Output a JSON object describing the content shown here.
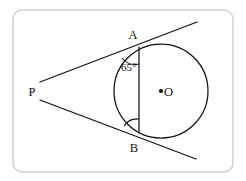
{
  "figure": {
    "kind": "geometry-diagram",
    "canvas": {
      "width": 246,
      "height": 181,
      "background": "#ffffff"
    },
    "frame": {
      "name": "rounded-border",
      "x": 13,
      "y": 10,
      "width": 220,
      "height": 162,
      "radius": 9,
      "color": "#cfcfcf",
      "stroke_width": 1.4
    },
    "stroke_color": "#111111",
    "labels": {
      "point_a": "A",
      "point_b": "B",
      "point_p": "P",
      "point_o": "O",
      "angle_a": "65°"
    },
    "label_positions": {
      "point_a": {
        "x": 133,
        "y": 39
      },
      "point_b": {
        "x": 134,
        "y": 152
      },
      "point_p": {
        "x": 32,
        "y": 96
      },
      "point_o": {
        "x": 164,
        "y": 96
      },
      "angle_a": {
        "x": 121,
        "y": 71
      }
    },
    "circle": {
      "name": "main-circle",
      "center": {
        "x": 161,
        "y": 91
      },
      "radius": 47,
      "center_dot_radius": 2.1
    },
    "points": {
      "A": {
        "x": 139,
        "y": 47
      },
      "B": {
        "x": 139,
        "y": 133
      },
      "P": {
        "x": 56,
        "y": 92
      },
      "O": {
        "x": 161,
        "y": 91
      }
    },
    "segments": [
      {
        "name": "tangent-line-upper",
        "x1": 40,
        "y1": 82,
        "x2": 197,
        "y2": 22
      },
      {
        "name": "tangent-line-lower",
        "x1": 40,
        "y1": 100,
        "x2": 196,
        "y2": 159
      },
      {
        "name": "chord-ab",
        "x1": 139,
        "y1": 47,
        "x2": 139,
        "y2": 133
      }
    ],
    "angle_arcs": [
      {
        "name": "angle-arc-a",
        "path": "M 122 58 A 17 17 0 0 0 139 64"
      },
      {
        "name": "angle-arc-b",
        "path": "M 139 119 A 16 16 0 0 0 124 126"
      }
    ],
    "chart_data": {
      "type": "diagram",
      "description": "Circle centered at O. External point P. Two tangent rays from P touch the circle at A (upper) and B (lower). Chord AB is drawn. The angle between tangent PA and chord AB at vertex A is labeled 65 degrees.",
      "known_values": [
        {
          "label": "65°",
          "at_vertex": "A",
          "between": [
            "tangent PA",
            "chord AB"
          ],
          "value": 65,
          "unit": "degrees"
        }
      ],
      "elements": [
        "circle O",
        "tangent PA",
        "tangent PB",
        "chord AB",
        "external point P"
      ]
    }
  }
}
